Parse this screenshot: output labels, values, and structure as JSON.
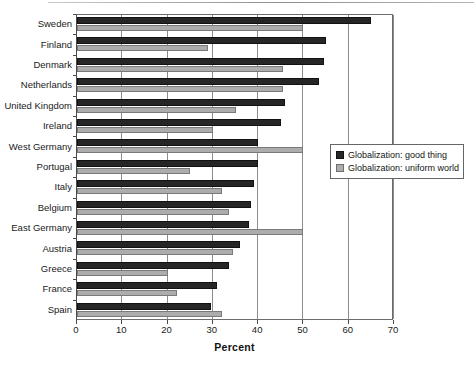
{
  "chart_data": {
    "type": "bar",
    "orientation": "horizontal",
    "title": "",
    "xlabel": "Percent",
    "ylabel": "",
    "xlim": [
      0,
      70
    ],
    "xticks": [
      0,
      10,
      20,
      30,
      40,
      50,
      60,
      70
    ],
    "grid": true,
    "grid_axis": "x",
    "legend_position": "center-right",
    "categories": [
      "Sweden",
      "Finland",
      "Denmark",
      "Netherlands",
      "United Kingdom",
      "Ireland",
      "West Germany",
      "Portugal",
      "Italy",
      "Belgium",
      "East Germany",
      "Austria",
      "Greece",
      "France",
      "Spain"
    ],
    "series": [
      {
        "name": "Globalization: good thing",
        "color": "#262626",
        "values": [
          65,
          55,
          54.5,
          53.5,
          46,
          45,
          40,
          40,
          39,
          38.5,
          38,
          36,
          33.5,
          31,
          29.5
        ]
      },
      {
        "name": "Globalization: uniform world",
        "color": "#acacac",
        "values": [
          50,
          29,
          45.5,
          45.5,
          35,
          30,
          50,
          25,
          32,
          33.5,
          50,
          34.5,
          20,
          22,
          32
        ]
      }
    ]
  },
  "legend": {
    "entries": [
      {
        "label": "Globalization: good thing",
        "swatch": "dark"
      },
      {
        "label": "Globalization: uniform world",
        "swatch": "light"
      }
    ]
  }
}
